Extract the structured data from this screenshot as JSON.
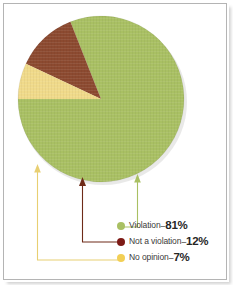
{
  "frame": {
    "border_color": "#b4b4b4",
    "background": "#ffffff"
  },
  "chart_data": {
    "type": "pie",
    "title": "",
    "categories": [
      "Violation",
      "Not a violation",
      "No opinion"
    ],
    "values": [
      81,
      12,
      7
    ],
    "value_suffix": "%",
    "colors": [
      "#a9c063",
      "#8c4a30",
      "#f0da8a"
    ],
    "legend_position": "bottom-right",
    "start_angle_deg": 180,
    "direction": "counterclockwise",
    "labels": [
      {
        "name": "Violation",
        "value": 81,
        "display": "81%",
        "color": "#a9c063"
      },
      {
        "name": "Not a violation",
        "value": 12,
        "display": "12%",
        "color": "#8c4a30"
      },
      {
        "name": "No opinion",
        "value": 7,
        "display": "7%",
        "color": "#f0da8a"
      }
    ]
  },
  "pie": {
    "center_x": 101,
    "center_y": 99,
    "radius": 83,
    "slices": [
      {
        "name": "violation-slice",
        "label": "Violation",
        "value": 81,
        "color": "#a9c063"
      },
      {
        "name": "not-a-violation-slice",
        "label": "Not a violation",
        "value": 12,
        "color": "#8c4a30"
      },
      {
        "name": "no-opinion-slice",
        "label": "No opinion",
        "value": 7,
        "color": "#f0da8a"
      }
    ]
  },
  "legend": {
    "separator": "–",
    "items": [
      {
        "label": "Violation",
        "percent": "81%",
        "color": "#a9c063"
      },
      {
        "label": "Not a violation",
        "percent": "12%",
        "color": "#7d1a16"
      },
      {
        "label": "No opinion",
        "percent": "7%",
        "color": "#f2cf55"
      }
    ]
  },
  "leaders": [
    {
      "name": "violation-leader",
      "color": "#a9c063"
    },
    {
      "name": "not-a-violation-leader",
      "color": "#6e2b18"
    },
    {
      "name": "no-opinion-leader",
      "color": "#e8cf72"
    }
  ]
}
